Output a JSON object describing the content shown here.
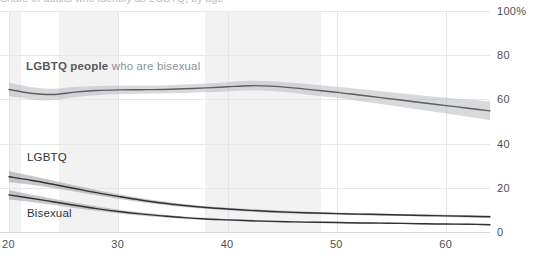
{
  "chart_data": {
    "type": "line",
    "title": "",
    "xlabel": "",
    "ylabel": "",
    "xlim": [
      20,
      64
    ],
    "ylim": [
      0,
      100
    ],
    "grid": true,
    "legend_position": "inline-annotations",
    "x_ticks": [
      "20",
      "30",
      "40",
      "50",
      "60"
    ],
    "x_tick_values": [
      20,
      30,
      40,
      50,
      60
    ],
    "y_ticks": [
      "0",
      "20",
      "40",
      "60",
      "80",
      "100%"
    ],
    "y_tick_values": [
      0,
      20,
      40,
      60,
      80,
      100
    ],
    "x": [
      20,
      22,
      24,
      26,
      28,
      30,
      32,
      34,
      36,
      38,
      40,
      42,
      44,
      46,
      48,
      50,
      52,
      54,
      56,
      58,
      60,
      62,
      64
    ],
    "series": [
      {
        "name": "LGBTQ people who are bisexual",
        "label_parts": {
          "strong": "LGBTQ people",
          "soft": "who are bisexual"
        },
        "color": "#5a5d63",
        "band_color": "#b8babd",
        "values": [
          64.5,
          62.8,
          62.2,
          63.3,
          64.0,
          64.3,
          64.4,
          64.5,
          64.8,
          65.2,
          65.7,
          66.2,
          66.0,
          65.2,
          64.2,
          63.2,
          62.0,
          60.8,
          59.6,
          58.4,
          57.2,
          56.0,
          54.8
        ],
        "ci_upper": [
          67.5,
          65.6,
          64.8,
          65.6,
          66.1,
          66.2,
          66.2,
          66.3,
          66.7,
          67.2,
          67.8,
          68.4,
          68.2,
          67.5,
          66.6,
          65.7,
          64.7,
          63.7,
          62.7,
          61.7,
          60.8,
          59.9,
          59.0
        ],
        "ci_lower": [
          61.5,
          60.0,
          59.6,
          61.0,
          61.9,
          62.4,
          62.6,
          62.7,
          62.9,
          63.2,
          63.6,
          64.0,
          63.8,
          62.9,
          61.8,
          60.7,
          59.3,
          57.9,
          56.5,
          55.1,
          53.6,
          52.1,
          50.6
        ]
      },
      {
        "name": "LGBTQ",
        "label_parts": {
          "strong": "LGBTQ",
          "soft": ""
        },
        "color": "#2f3237",
        "band_color": "#9a9ca0",
        "values": [
          25.0,
          23.4,
          21.6,
          19.7,
          17.8,
          16.1,
          14.5,
          13.1,
          12.0,
          11.1,
          10.4,
          9.8,
          9.3,
          8.9,
          8.6,
          8.3,
          8.1,
          7.9,
          7.7,
          7.5,
          7.3,
          7.1,
          6.9
        ],
        "ci_upper": [
          27.6,
          25.4,
          23.3,
          21.1,
          19.0,
          17.1,
          15.4,
          13.9,
          12.7,
          11.7,
          11.0,
          10.4,
          9.9,
          9.5,
          9.1,
          8.8,
          8.6,
          8.4,
          8.2,
          8.0,
          7.8,
          7.6,
          7.5
        ],
        "ci_lower": [
          22.6,
          21.4,
          19.9,
          18.3,
          16.6,
          15.1,
          13.6,
          12.3,
          11.3,
          10.5,
          9.8,
          9.2,
          8.7,
          8.3,
          8.0,
          7.8,
          7.6,
          7.4,
          7.2,
          7.0,
          6.8,
          6.6,
          6.4
        ]
      },
      {
        "name": "Bisexual",
        "label_parts": {
          "strong": "Bisexual",
          "soft": ""
        },
        "color": "#2f3237",
        "band_color": "#9a9ca0",
        "values": [
          16.8,
          15.3,
          13.7,
          12.1,
          10.6,
          9.3,
          8.2,
          7.3,
          6.5,
          5.9,
          5.5,
          5.1,
          4.8,
          4.6,
          4.4,
          4.3,
          4.1,
          4.0,
          3.9,
          3.7,
          3.6,
          3.5,
          3.3
        ],
        "ci_upper": [
          18.9,
          17.0,
          15.1,
          13.3,
          11.6,
          10.1,
          8.9,
          7.9,
          7.0,
          6.4,
          5.9,
          5.5,
          5.2,
          4.9,
          4.7,
          4.6,
          4.4,
          4.3,
          4.2,
          4.0,
          3.9,
          3.8,
          3.7
        ],
        "ci_lower": [
          14.7,
          13.6,
          12.3,
          10.9,
          9.6,
          8.5,
          7.5,
          6.7,
          6.0,
          5.4,
          5.1,
          4.7,
          4.4,
          4.3,
          4.1,
          4.0,
          3.8,
          3.7,
          3.6,
          3.4,
          3.3,
          3.2,
          2.9
        ]
      }
    ],
    "shaded_age_bands": [
      {
        "from": 20.0,
        "to": 21.1
      },
      {
        "from": 24.6,
        "to": 30.0
      },
      {
        "from": 37.9,
        "to": 48.5
      }
    ],
    "annotations": [
      {
        "id": "bisexual-share-label",
        "text": "LGBTQ people who are bisexual"
      },
      {
        "id": "lgbtq-label",
        "text": "LGBTQ"
      },
      {
        "id": "bisexual-label",
        "text": "Bisexual"
      }
    ]
  },
  "axis": {
    "y_suffix": "%",
    "x_ticks": [
      {
        "label": "20",
        "value": 20
      },
      {
        "label": "30",
        "value": 30
      },
      {
        "label": "40",
        "value": 40
      },
      {
        "label": "50",
        "value": 50
      },
      {
        "label": "60",
        "value": 60
      }
    ],
    "y_ticks": [
      {
        "label": "100%",
        "value": 100
      },
      {
        "label": "80",
        "value": 80
      },
      {
        "label": "60",
        "value": 60
      },
      {
        "label": "40",
        "value": 40
      },
      {
        "label": "20",
        "value": 20
      },
      {
        "label": "0",
        "value": 0
      }
    ]
  },
  "labels": {
    "bisexual_share_strong": "LGBTQ people",
    "bisexual_share_soft": "who are bisexual",
    "lgbtq": "LGBTQ",
    "bisexual": "Bisexual"
  },
  "title_strip": {
    "text": "Share of adults who identify as LGBTQ, by age"
  },
  "colors": {
    "line_dark": "#2f3237",
    "line_gray": "#5a5d63",
    "band_gray": "#b8babd",
    "band_dark": "#9a9ca0",
    "gridline": "#e3e4e7",
    "shaded_band": "#f2f2f3",
    "tick_text": "#4c4f54"
  }
}
